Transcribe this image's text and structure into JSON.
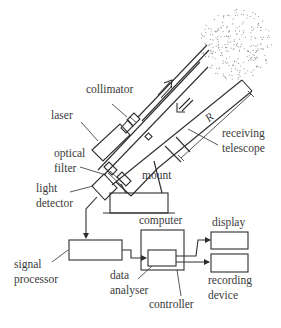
{
  "diagram": {
    "labels": {
      "collimator": "collimator",
      "laser": "laser",
      "optical_filter": [
        "optical",
        "filter"
      ],
      "light_detector": [
        "light",
        "detector"
      ],
      "mount": "mount",
      "receiving_telescope": [
        "receiving",
        "telescope"
      ],
      "range_symbol": "R",
      "computer": "computer",
      "display": "display",
      "signal_processor": [
        "signal",
        "processor"
      ],
      "data_analyser": [
        "data",
        "analyser"
      ],
      "recording_device": [
        "recording",
        "device"
      ],
      "controller": "controller"
    },
    "components": [
      "laser",
      "collimator",
      "optical filter",
      "light detector",
      "mount",
      "receiving telescope",
      "signal processor",
      "computer",
      "data analyser",
      "controller",
      "display",
      "recording device",
      "scattering cloud"
    ],
    "flows": [
      {
        "from": "light detector",
        "to": "signal processor"
      },
      {
        "from": "signal processor",
        "to": "data analyser"
      },
      {
        "from": "data analyser",
        "to": "display"
      },
      {
        "from": "data analyser",
        "to": "recording device"
      }
    ],
    "arrows": [
      {
        "name": "outgoing-beam-arrow",
        "direction": "up-right"
      },
      {
        "name": "return-beam-arrow",
        "direction": "down-left"
      }
    ]
  }
}
